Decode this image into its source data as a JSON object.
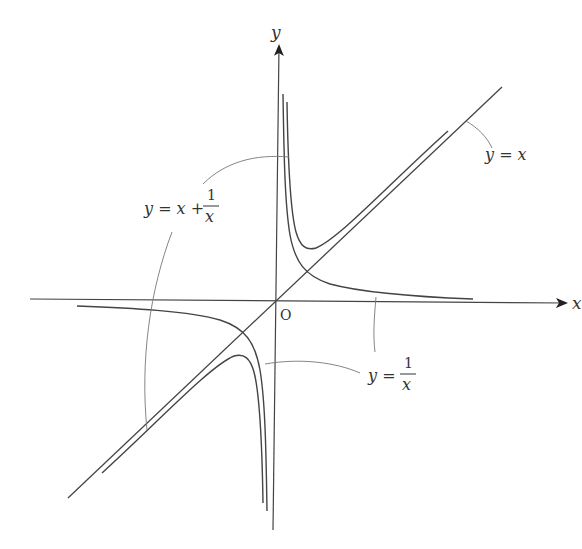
{
  "diagram": {
    "title": "",
    "axes": {
      "x_label": "x",
      "y_label": "y",
      "origin_label": "O"
    },
    "curves": [
      {
        "name": "line-y-equals-x",
        "label": "y = x"
      },
      {
        "name": "hyperbola-y-equals-1-over-x",
        "label_lhs": "y =",
        "label_num": "1",
        "label_den": "x"
      },
      {
        "name": "curve-y-equals-x-plus-1-over-x",
        "label_lhs": "y = x +",
        "label_num": "1",
        "label_den": "x"
      }
    ],
    "colors": {
      "stroke": "#444444",
      "leader": "#777777",
      "text": "#333333",
      "background": "#ffffff"
    }
  }
}
